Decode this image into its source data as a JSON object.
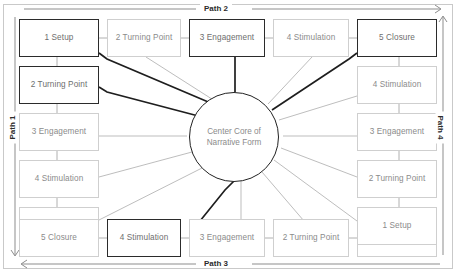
{
  "diagram": {
    "core": {
      "line1": "Center Core of",
      "line2": "Narrative Form",
      "label": "Center Core of Narrative Form"
    },
    "paths": {
      "path1": {
        "label": "Path 1",
        "position": "left",
        "direction": "down"
      },
      "path2": {
        "label": "Path 2",
        "position": "top",
        "direction": "right"
      },
      "path3": {
        "label": "Path 3",
        "position": "bottom",
        "direction": "left"
      },
      "path4": {
        "label": "Path 4",
        "position": "right",
        "direction": "up"
      }
    },
    "nodes": {
      "top": [
        {
          "label": "1 Setup",
          "emphasis": true
        },
        {
          "label": "2 Turning Point",
          "emphasis": false
        },
        {
          "label": "3 Engagement",
          "emphasis": true
        },
        {
          "label": "4 Stimulation",
          "emphasis": false
        },
        {
          "label": "5 Closure",
          "emphasis": true
        }
      ],
      "left": [
        {
          "label": "2 Turning Point",
          "emphasis": true
        },
        {
          "label": "3 Engagement",
          "emphasis": false
        },
        {
          "label": "4 Stimulation",
          "emphasis": false
        },
        {
          "label": "5 Closure",
          "emphasis": false
        }
      ],
      "bottom": [
        {
          "label": "5 Closure",
          "emphasis": false
        },
        {
          "label": "4 Stimulation",
          "emphasis": true
        },
        {
          "label": "3 Engagement",
          "emphasis": false
        },
        {
          "label": "2 Turning Point",
          "emphasis": false
        },
        {
          "label": "1 Setup",
          "emphasis": false
        }
      ],
      "right": [
        {
          "label": "4 Stimulation",
          "emphasis": false
        },
        {
          "label": "3 Engagement",
          "emphasis": false
        },
        {
          "label": "2 Turning Point",
          "emphasis": false
        },
        {
          "label": "1 Setup",
          "emphasis": false
        }
      ]
    },
    "colors": {
      "emphasis_border": "#2b2b2b",
      "normal_border": "#cfcfcf",
      "text": "#8b8b8b",
      "frame": "#c9c9c9",
      "spoke_light": "#b5b5b5",
      "spoke_dark": "#1e1e1e"
    }
  }
}
